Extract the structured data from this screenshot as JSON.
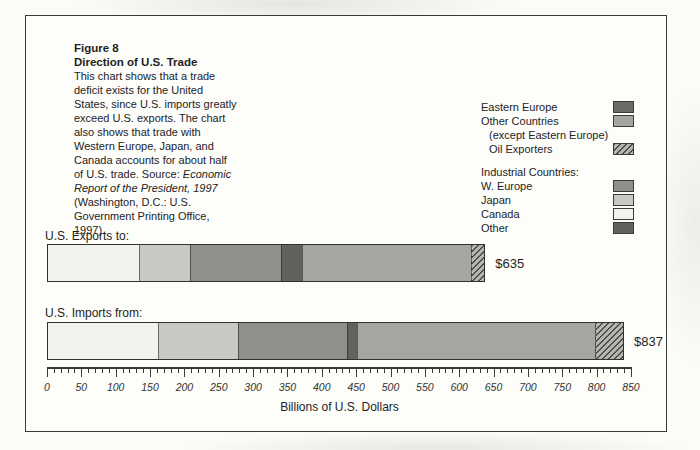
{
  "figure": {
    "label": "Figure 8",
    "title": "Direction of U.S. Trade",
    "description_lines": [
      [
        {
          "t": "This chart shows that a trade",
          "i": false
        }
      ],
      [
        {
          "t": "deficit exists for the United",
          "i": false
        }
      ],
      [
        {
          "t": "States, since U.S. imports greatly",
          "i": false
        }
      ],
      [
        {
          "t": "exceed U.S. exports. The chart",
          "i": false
        }
      ],
      [
        {
          "t": "also shows that trade with",
          "i": false
        }
      ],
      [
        {
          "t": "Western Europe, Japan, and",
          "i": false
        }
      ],
      [
        {
          "t": "Canada accounts for about half",
          "i": false
        }
      ],
      [
        {
          "t": "of U.S. trade. Source: ",
          "i": false
        },
        {
          "t": "Economic",
          "i": true
        }
      ],
      [
        {
          "t": "Report of the President, 1997",
          "i": true
        }
      ],
      [
        {
          "t": "(Washington, D.C.: U.S.",
          "i": false
        }
      ],
      [
        {
          "t": "Government Printing Office,",
          "i": false
        }
      ],
      [
        {
          "t": "1997).",
          "i": false
        }
      ]
    ]
  },
  "legend": {
    "groups": [
      {
        "header": "",
        "items": [
          {
            "label": "Eastern Europe",
            "colorKey": "eastern_europe",
            "indent": false
          },
          {
            "label": "Other Countries",
            "colorKey": "other_countries",
            "indent": false
          },
          {
            "label": "(except Eastern Europe)",
            "colorKey": null,
            "indent": true
          },
          {
            "label": "Oil Exporters",
            "colorKey": "oil_exporters",
            "indent": true
          }
        ]
      },
      {
        "header": "Industrial Countries:",
        "items": [
          {
            "label": "W. Europe",
            "colorKey": "w_europe",
            "indent": false
          },
          {
            "label": "Japan",
            "colorKey": "japan",
            "indent": false
          },
          {
            "label": "Canada",
            "colorKey": "canada",
            "indent": false
          },
          {
            "label": "Other",
            "colorKey": "other_industrial",
            "indent": false
          }
        ]
      }
    ]
  },
  "chart_data": {
    "type": "bar",
    "orientation": "horizontal-stacked",
    "xlabel": "Billions of U.S. Dollars",
    "axis": {
      "min": 0,
      "max": 850,
      "major_step": 50,
      "minor_step": 10
    },
    "bars": [
      {
        "label": "U.S. Exports to:",
        "total": 635,
        "total_label": "$635",
        "segments": [
          {
            "name": "Canada",
            "colorKey": "canada",
            "value": 133
          },
          {
            "name": "Japan",
            "colorKey": "japan",
            "value": 72
          },
          {
            "name": "W. Europe",
            "colorKey": "w_europe",
            "value": 132
          },
          {
            "name": "Other (industrial)",
            "colorKey": "other_industrial",
            "value": 28
          },
          {
            "name": "Other Countries (except Eastern Europe)",
            "colorKey": "other_countries",
            "value": 245
          },
          {
            "name": "Oil Exporters",
            "colorKey": "oil_exporters",
            "value": 19
          },
          {
            "name": "Eastern Europe",
            "colorKey": "eastern_europe",
            "value": 6
          }
        ]
      },
      {
        "label": "U.S. Imports from:",
        "total": 837,
        "total_label": "$837",
        "segments": [
          {
            "name": "Canada",
            "colorKey": "canada",
            "value": 160
          },
          {
            "name": "Japan",
            "colorKey": "japan",
            "value": 115
          },
          {
            "name": "W. Europe",
            "colorKey": "w_europe",
            "value": 158
          },
          {
            "name": "Other (industrial)",
            "colorKey": "other_industrial",
            "value": 13
          },
          {
            "name": "Other Countries (except Eastern Europe)",
            "colorKey": "other_countries",
            "value": 344
          },
          {
            "name": "Oil Exporters",
            "colorKey": "oil_exporters",
            "value": 41
          },
          {
            "name": "Eastern Europe",
            "colorKey": "eastern_europe",
            "value": 6
          }
        ]
      }
    ]
  },
  "colors": {
    "canada": "#f2f2ee",
    "japan": "#c8c8c4",
    "w_europe": "#8f8f8c",
    "other_industrial": "#61615e",
    "other_countries": "#a5a5a2",
    "eastern_europe": "#6a6a66",
    "oil_hatch_line": "#4e4e4a",
    "oil_hatch_bg": "#b5b5b1"
  }
}
